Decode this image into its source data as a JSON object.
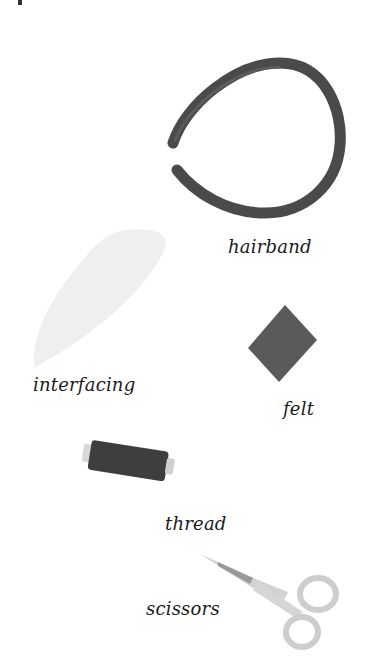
{
  "page": {
    "title": "",
    "items": [
      {
        "id": "hairband",
        "label": "hairband",
        "color": "#4a4a4a"
      },
      {
        "id": "interfacing",
        "label": "interfacing",
        "color": "#f0f0f0"
      },
      {
        "id": "felt",
        "label": "felt",
        "color": "#5a5a5a"
      },
      {
        "id": "thread",
        "label": "thread",
        "color": "#3e3e3e"
      },
      {
        "id": "scissors",
        "label": "scissors",
        "color": "#cfcfcf"
      }
    ]
  }
}
